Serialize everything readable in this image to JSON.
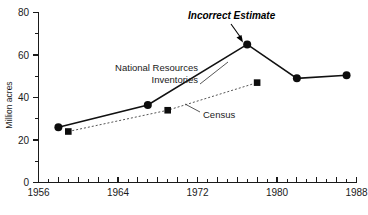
{
  "chart_data": {
    "type": "line",
    "title": "",
    "subtitle": "",
    "xlabel": "",
    "ylabel": "Million acres",
    "xlim": [
      1956,
      1988
    ],
    "ylim": [
      0,
      80
    ],
    "grid": false,
    "legend_position": "inline-annotations",
    "x_ticks_major": [
      1956,
      1964,
      1972,
      1980,
      1988
    ],
    "x_tick_labels": [
      "1956",
      "1964",
      "1972",
      "1980",
      "1988"
    ],
    "x_ticks_minor_step": 1,
    "y_ticks_major": [
      0,
      20,
      40,
      60,
      80
    ],
    "y_tick_labels": [
      "0",
      "20",
      "40",
      "60",
      "80"
    ],
    "y_ticks_minor": [
      10,
      30,
      50,
      70
    ],
    "series": [
      {
        "name": "National Resources Inventories",
        "label_lines": [
          "National Resources",
          "Inventories"
        ],
        "marker": "circle",
        "style": "solid",
        "color": "#111111",
        "points": [
          {
            "x": 1958,
            "y": 26
          },
          {
            "x": 1967,
            "y": 36.5
          },
          {
            "x": 1977,
            "y": 65
          },
          {
            "x": 1982,
            "y": 49
          },
          {
            "x": 1987,
            "y": 50.5
          }
        ]
      },
      {
        "name": "Census",
        "label_lines": [
          "Census"
        ],
        "marker": "square",
        "style": "dashed",
        "color": "#555555",
        "points": [
          {
            "x": 1959,
            "y": 24
          },
          {
            "x": 1969,
            "y": 34
          },
          {
            "x": 1978,
            "y": 47
          }
        ]
      }
    ],
    "annotations": [
      {
        "text": "Incorrect Estimate",
        "style": "bold-italic",
        "points_to": {
          "x": 1977,
          "y": 65
        }
      }
    ]
  },
  "labels": {
    "y_axis_title": "Million acres",
    "nri_line1": "National Resources",
    "nri_line2": "Inventories",
    "census": "Census",
    "annotation": "Incorrect Estimate",
    "x0": "1956",
    "x1": "1964",
    "x2": "1972",
    "x3": "1980",
    "x4": "1988",
    "y0": "0",
    "y1": "20",
    "y2": "40",
    "y3": "60",
    "y4": "80"
  },
  "colors": {
    "background": "#ffffff",
    "ink": "#1a1a1a",
    "nri": "#111111",
    "census": "#555555"
  }
}
